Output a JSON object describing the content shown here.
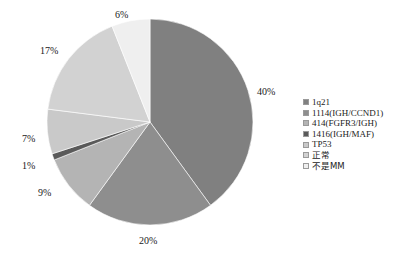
{
  "chart_data": {
    "type": "pie",
    "title": "",
    "categories": [
      "1q21",
      "1114(IGH/CCND1)",
      "414(FGFR3/IGH)",
      "1416(IGH/MAF)",
      "TP53",
      "正常",
      "不是MM"
    ],
    "values": [
      40,
      20,
      9,
      1,
      7,
      17,
      6
    ],
    "value_labels": [
      "40%",
      "20%",
      "9%",
      "1%",
      "7%",
      "17%",
      "6%"
    ],
    "unit": "%",
    "legend_position": "right",
    "grid": false,
    "start_angle_deg": 0,
    "direction": "clockwise",
    "colors": [
      "#808080",
      "#8e8e8e",
      "#b4b4b4",
      "#5a5a5a",
      "#c9c9c9",
      "#d2d2d2",
      "#efefef"
    ]
  },
  "labels": {
    "slice_0": "40%",
    "slice_1": "20%",
    "slice_2": "9%",
    "slice_3": "1%",
    "slice_4": "7%",
    "slice_5": "17%",
    "slice_6": "6%"
  },
  "legend": {
    "items": [
      {
        "label": "1q21",
        "color": "#808080"
      },
      {
        "label": "1114(IGH/CCND1)",
        "color": "#8e8e8e"
      },
      {
        "label": "414(FGFR3/IGH)",
        "color": "#b4b4b4"
      },
      {
        "label": "1416(IGH/MAF)",
        "color": "#5a5a5a"
      },
      {
        "label": "TP53",
        "color": "#c9c9c9"
      },
      {
        "label": "正常",
        "color": "#d2d2d2"
      },
      {
        "label": "不是MM",
        "color": "#efefef"
      }
    ]
  }
}
